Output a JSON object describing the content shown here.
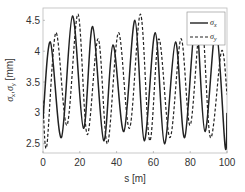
{
  "chart_data": {
    "type": "line",
    "title": "",
    "xlabel": "s [m]",
    "ylabel": "σx, σy [mm]",
    "xlim": [
      0,
      100
    ],
    "ylim": [
      2.35,
      4.7
    ],
    "xticks": [
      0,
      20,
      40,
      60,
      80,
      100
    ],
    "yticks": [
      2.5,
      3,
      3.5,
      4,
      4.5
    ],
    "xtick_labels": [
      "0",
      "20",
      "40",
      "60",
      "80",
      "100"
    ],
    "ytick_labels": [
      "2.5",
      "3",
      "3.5",
      "4",
      "4.5"
    ],
    "grid": false,
    "legend_position": "upper right",
    "series": [
      {
        "name": "σx",
        "style": "solid",
        "color": "#222222",
        "x": [
          0,
          4,
          10,
          16,
          22,
          27,
          33,
          38,
          44,
          50,
          55,
          61,
          66,
          72,
          77,
          83,
          88,
          94,
          99,
          100
        ],
        "y": [
          2.9,
          4.15,
          2.6,
          4.57,
          2.75,
          4.4,
          2.55,
          4.1,
          2.7,
          4.5,
          2.55,
          4.3,
          2.5,
          4.15,
          2.6,
          4.5,
          2.7,
          4.35,
          2.45,
          3.0
        ]
      },
      {
        "name": "σy",
        "style": "dashed",
        "color": "#222222",
        "x": [
          0,
          2,
          7,
          13,
          19,
          24,
          30,
          35,
          41,
          47,
          53,
          58,
          63,
          69,
          75,
          80,
          86,
          91,
          97,
          100
        ],
        "y": [
          3.2,
          2.45,
          4.3,
          2.8,
          4.6,
          2.65,
          4.2,
          2.5,
          4.3,
          2.75,
          4.6,
          2.55,
          4.2,
          2.6,
          4.2,
          2.8,
          4.55,
          2.6,
          4.0,
          3.3
        ]
      }
    ]
  },
  "legend": {
    "items": [
      {
        "label": "σ",
        "sub": "x",
        "style": "solid"
      },
      {
        "label": "σ",
        "sub": "y",
        "style": "dashed"
      }
    ]
  },
  "axes": {
    "xlabel": "s [m]",
    "ylabel_main": "σ",
    "ylabel_sub1": "x",
    "ylabel_sep": ",",
    "ylabel_sub2": "y",
    "ylabel_unit": " [mm]"
  }
}
